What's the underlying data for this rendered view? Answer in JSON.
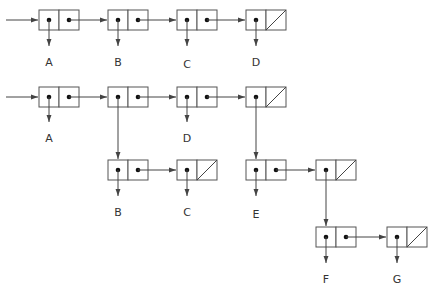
{
  "diagram": {
    "title": "",
    "type": "linked list box-and-pointer",
    "colors": {
      "line": "#444444",
      "box": "#555555",
      "dot": "#111111",
      "text": "#333333"
    },
    "lists": [
      {
        "name": "flat-list",
        "cells": [
          {
            "car": "A",
            "cdr": "next"
          },
          {
            "car": "B",
            "cdr": "next"
          },
          {
            "car": "C",
            "cdr": "next"
          },
          {
            "car": "D",
            "cdr": "nil"
          }
        ]
      },
      {
        "name": "nested-list",
        "cells": [
          {
            "car": "A",
            "cdr": "next"
          },
          {
            "car": "sublist-1",
            "cdr": "next"
          },
          {
            "car": "D",
            "cdr": "next"
          },
          {
            "car": "sublist-2",
            "cdr": "nil"
          }
        ],
        "sublists": [
          {
            "name": "sublist-1",
            "cells": [
              {
                "car": "B",
                "cdr": "next"
              },
              {
                "car": "C",
                "cdr": "nil"
              }
            ]
          },
          {
            "name": "sublist-2",
            "cells": [
              {
                "car": "E",
                "cdr": "next"
              },
              {
                "car": "sublist-3",
                "cdr": "nil"
              }
            ]
          },
          {
            "name": "sublist-3",
            "cells": [
              {
                "car": "F",
                "cdr": "next"
              },
              {
                "car": "G",
                "cdr": "nil"
              }
            ]
          }
        ]
      }
    ],
    "labels": {
      "r1": [
        "A",
        "B",
        "C",
        "D"
      ],
      "r2": [
        "A",
        "D"
      ],
      "r3": [
        "B",
        "C",
        "E"
      ],
      "r4": [
        "F",
        "G"
      ]
    }
  }
}
